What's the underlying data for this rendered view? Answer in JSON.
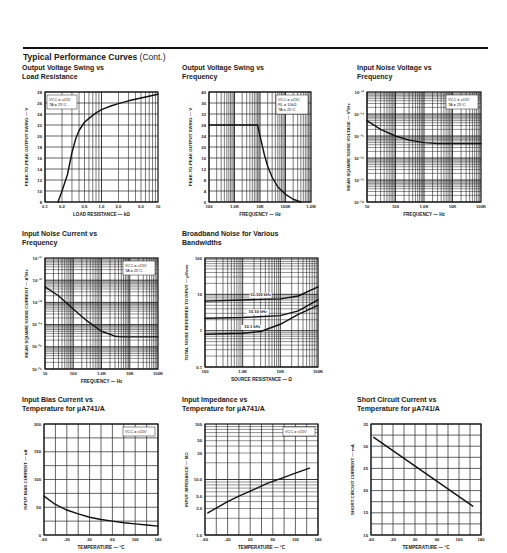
{
  "page": {
    "section_title": "Typical Performance Curves",
    "section_suffix": "(Cont.)"
  },
  "chart_data": [
    {
      "id": "c1",
      "type": "line",
      "title": "Output Voltage Swing vs Load Resistance",
      "xlabel": "LOAD RESISTANCE — kΩ",
      "ylabel": "PEAK-TO-PEAK OUTPUT SWING — V",
      "xscale": "log",
      "xlim": [
        0.1,
        10
      ],
      "ylim": [
        8,
        28
      ],
      "xticks": [
        0.1,
        0.2,
        0.5,
        1.0,
        2.0,
        5.0,
        10
      ],
      "xticklabels": [
        "0.1",
        "0.2",
        "0.5",
        "1.0",
        "2.0",
        "5.0",
        "10"
      ],
      "yticks": [
        8,
        10,
        12,
        14,
        16,
        18,
        20,
        22,
        24,
        26,
        28
      ],
      "annotation": [
        "VCC = ±15V",
        "TA = 25°C"
      ],
      "grid": true,
      "series": [
        {
          "name": "Vout swing",
          "x": [
            0.17,
            0.2,
            0.25,
            0.3,
            0.35,
            0.4,
            0.5,
            0.6,
            0.8,
            1.0,
            1.5,
            2.0,
            3.0,
            5.0,
            10
          ],
          "y": [
            8,
            10,
            13,
            17,
            19.5,
            21,
            22.5,
            23.2,
            24.2,
            24.8,
            25.5,
            25.9,
            26.4,
            26.9,
            27.6
          ]
        }
      ]
    },
    {
      "id": "c2",
      "type": "line",
      "title": "Output Voltage Swing vs Frequency",
      "xlabel": "FREQUENCY — Hz",
      "ylabel": "PEAK-TO-PEAK OUTPUT SWING — V",
      "xscale": "log",
      "xlim": [
        100,
        1000000
      ],
      "ylim": [
        0,
        40
      ],
      "xticks": [
        100,
        1000,
        10000,
        100000,
        1000000
      ],
      "xticklabels": [
        "100",
        "1.0K",
        "10K",
        "100K",
        "1.0M"
      ],
      "yticks": [
        0,
        4,
        8,
        12,
        16,
        20,
        24,
        28,
        32,
        36,
        40
      ],
      "annotation": [
        "VCC = ±15V",
        "RL = 10kΩ",
        "TA = 25°C"
      ],
      "grid": true,
      "series": [
        {
          "name": "Vout swing",
          "x": [
            100,
            8000,
            10000,
            15000,
            20000,
            30000,
            50000,
            100000,
            200000,
            400000
          ],
          "y": [
            28,
            28,
            24,
            17,
            13,
            9,
            5.5,
            2.8,
            1,
            0
          ]
        }
      ]
    },
    {
      "id": "c3",
      "type": "line",
      "title": "Input Noise Voltage vs Frequency",
      "xlabel": "FREQUENCY — Hz",
      "ylabel": "MEAN SQUARE NOISE VOLTAGE — V²/Hz",
      "xscale": "log",
      "yscale": "log",
      "xlim": [
        10,
        100000
      ],
      "ylim": [
        1e-18,
        1e-13
      ],
      "xticks": [
        10,
        100,
        1000,
        10000,
        100000
      ],
      "xticklabels": [
        "10",
        "100",
        "1.0K",
        "10K",
        "100K"
      ],
      "yticks": [
        1e-18,
        1e-17,
        1e-16,
        1e-15,
        1e-14,
        1e-13
      ],
      "yticklabels": [
        "10⁻¹⁸",
        "10⁻¹⁷",
        "10⁻¹⁶",
        "10⁻¹⁵",
        "10⁻¹⁴",
        "10⁻¹³"
      ],
      "annotation": [
        "VCC = ±15V",
        "TA = 25°C"
      ],
      "grid": true,
      "series": [
        {
          "name": "en²",
          "x": [
            10,
            30,
            100,
            300,
            1000,
            3000,
            10000,
            100000
          ],
          "y": [
            5e-15,
            2e-15,
            1e-15,
            6.5e-16,
            5e-16,
            4.5e-16,
            4.5e-16,
            4.5e-16
          ]
        }
      ]
    },
    {
      "id": "c4",
      "type": "line",
      "title": "Input Noise Current vs Frequency",
      "xlabel": "FREQUENCY — Hz",
      "ylabel": "MEAN SQUARE NOISE CURRENT — A²/Hz",
      "xscale": "log",
      "yscale": "log",
      "xlim": [
        10,
        100000
      ],
      "ylim": [
        1e-26,
        1e-21
      ],
      "xticks": [
        10,
        100,
        1000,
        10000,
        100000
      ],
      "xticklabels": [
        "10",
        "100",
        "1.0K",
        "10K",
        "100K"
      ],
      "yticks": [
        1e-26,
        1e-25,
        1e-24,
        1e-23,
        1e-22,
        1e-21
      ],
      "yticklabels": [
        "10⁻²⁶",
        "10⁻²⁵",
        "10⁻²⁴",
        "10⁻²³",
        "10⁻²²",
        "10⁻²¹"
      ],
      "annotation": [
        "VCC = ±15V",
        "TA = 25°C"
      ],
      "grid": true,
      "series": [
        {
          "name": "in²",
          "x": [
            10,
            30,
            100,
            300,
            1000,
            3000,
            5000,
            10000,
            100000
          ],
          "y": [
            5e-23,
            2e-23,
            5e-24,
            1.5e-24,
            5e-25,
            3e-25,
            2.8e-25,
            2.8e-25,
            2.8e-25
          ]
        }
      ]
    },
    {
      "id": "c5",
      "type": "line",
      "title": "Broadband Noise for Various Bandwidths",
      "xlabel": "SOURCE RESISTANCE — Ω",
      "ylabel": "TOTAL NOISE REFERRED TO INPUT — µVrms",
      "xscale": "log",
      "yscale": "log",
      "xlim": [
        100,
        100000
      ],
      "ylim": [
        0.1,
        100
      ],
      "xticks": [
        100,
        1000,
        10000,
        100000
      ],
      "xticklabels": [
        "100",
        "1.0K",
        "10K",
        "100K"
      ],
      "yticks": [
        0.1,
        1,
        10,
        100
      ],
      "yticklabels": [
        "0.1",
        "1",
        "10",
        "100"
      ],
      "grid": true,
      "series": [
        {
          "name": "10-100 kHz",
          "x": [
            100,
            1000,
            10000,
            30000,
            100000
          ],
          "y": [
            6.5,
            7,
            7.5,
            9,
            16
          ]
        },
        {
          "name": "10-10 kHz",
          "x": [
            100,
            1000,
            10000,
            30000,
            100000
          ],
          "y": [
            2.2,
            2.3,
            2.6,
            3.5,
            7
          ]
        },
        {
          "name": "10-1 kHz",
          "x": [
            100,
            1000,
            3000,
            10000,
            30000,
            100000
          ],
          "y": [
            0.8,
            0.85,
            0.95,
            1.5,
            2.8,
            5
          ]
        }
      ]
    },
    {
      "id": "c6",
      "type": "line",
      "title": "Input Bias Current vs Temperature for µA741/A",
      "xlabel": "TEMPERATURE — °C",
      "ylabel": "INPUT BIAS CURRENT — nA",
      "xlim": [
        -60,
        140
      ],
      "ylim": [
        0,
        200
      ],
      "xticks": [
        -60,
        -20,
        20,
        60,
        100,
        140
      ],
      "yticks": [
        0,
        50,
        100,
        150,
        200
      ],
      "annotation": [
        "VCC = ±15V"
      ],
      "grid": true,
      "series": [
        {
          "name": "IB",
          "x": [
            -60,
            -40,
            -20,
            0,
            20,
            40,
            60,
            80,
            100,
            120,
            140
          ],
          "y": [
            70,
            55,
            45,
            38,
            32,
            28,
            25,
            22,
            20,
            18,
            16
          ]
        }
      ]
    },
    {
      "id": "c7",
      "type": "line",
      "title": "Input Impedance vs Temperature for µA741/A",
      "xlabel": "TEMPERATURE — °C",
      "ylabel": "INPUT IMPEDANCE — MΩ",
      "yscale": "log",
      "xlim": [
        -60,
        140
      ],
      "ylim": [
        1.0,
        100
      ],
      "xticks": [
        -60,
        -20,
        20,
        60,
        100,
        140
      ],
      "yticks": [
        1.0,
        3.0,
        5.0,
        10.0,
        30,
        50,
        100
      ],
      "yticklabels": [
        "1.0",
        "3.0",
        "5.0",
        "10.0",
        "30",
        "50",
        "100"
      ],
      "annotation": [
        "VCC = ±15V"
      ],
      "grid": true,
      "series": [
        {
          "name": "Zin",
          "x": [
            -55,
            -20,
            0,
            25,
            50,
            75,
            100,
            125
          ],
          "y": [
            2.5,
            4,
            5,
            6.5,
            8.5,
            10.5,
            13,
            16
          ]
        }
      ]
    },
    {
      "id": "c8",
      "type": "line",
      "title": "Short Circuit Current vs Temperature for µA741/A",
      "xlabel": "TEMPERATURE — °C",
      "ylabel": "SHORT CIRCUIT CURRENT — mA",
      "xlim": [
        -60,
        140
      ],
      "ylim": [
        10,
        35
      ],
      "xticks": [
        -60,
        -20,
        20,
        60,
        100,
        140
      ],
      "yticks": [
        10,
        15,
        20,
        25,
        30,
        35
      ],
      "grid": true,
      "series": [
        {
          "name": "ISC",
          "x": [
            -55,
            125
          ],
          "y": [
            32,
            16.5
          ]
        }
      ]
    }
  ]
}
